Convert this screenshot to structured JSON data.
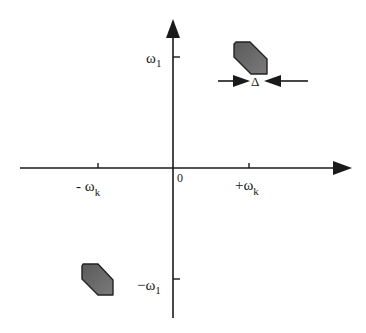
{
  "diagram": {
    "type": "frequency-plane",
    "origin_label": "0",
    "axes": {
      "horizontal": {
        "ticks": [
          {
            "label_prefix": "- ",
            "symbol": "ω",
            "subscript": "k",
            "position": "negative"
          },
          {
            "label_prefix": "+",
            "symbol": "ω",
            "subscript": "k",
            "position": "positive"
          }
        ]
      },
      "vertical": {
        "ticks": [
          {
            "label_prefix": "",
            "symbol": "ω",
            "subscript": "1",
            "position": "positive"
          },
          {
            "label_prefix": "−",
            "symbol": "ω",
            "subscript": "1",
            "position": "negative"
          }
        ]
      }
    },
    "regions": [
      {
        "name": "passband-upper-right",
        "quadrant": "I"
      },
      {
        "name": "passband-lower-left",
        "quadrant": "III"
      }
    ],
    "width_marker": {
      "label": "Δ"
    },
    "colors": {
      "axis": "#1a1a1a",
      "region_fill": "#6b6b6b",
      "region_stroke": "#222222"
    }
  }
}
